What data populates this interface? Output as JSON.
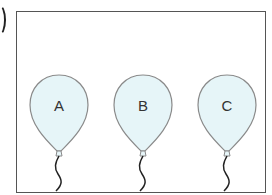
{
  "figure": {
    "colors": {
      "frame": "#555555",
      "balloon_fill": "#e6f5f8",
      "balloon_stroke": "#8a8a8a",
      "string": "#222222",
      "label_text": "#333333"
    },
    "balloons": [
      {
        "label": "A",
        "cx": 59
      },
      {
        "label": "B",
        "cx": 143
      },
      {
        "label": "C",
        "cx": 227
      }
    ]
  }
}
